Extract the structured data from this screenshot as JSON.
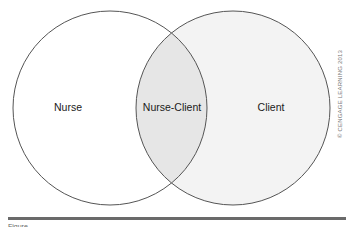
{
  "diagram": {
    "type": "venn",
    "sets": [
      {
        "label": "Nurse",
        "fill": "#ffffff"
      },
      {
        "label": "Client",
        "fill": "#f3f3f3"
      }
    ],
    "intersection": {
      "label": "Nurse-Client",
      "fill": "#e6e6e6"
    },
    "stroke": "#555555"
  },
  "copyright": "© CENGAGE LEARNING 2013",
  "caption": "Figure"
}
